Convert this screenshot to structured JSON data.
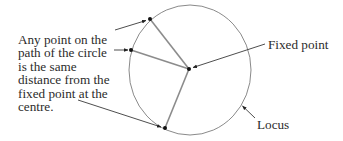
{
  "diagram": {
    "description_lines": [
      "Any point on the",
      "path of the circle",
      "is the same",
      "distance from the",
      "fixed point at the",
      "centre."
    ],
    "labels": {
      "fixed_point": "Fixed point",
      "locus": "Locus"
    },
    "circle": {
      "cx": 190,
      "cy": 70,
      "rx": 61,
      "ry": 65,
      "stroke": "#8a8a8a"
    },
    "centre_point": {
      "x": 189,
      "y": 69
    },
    "points_on_circle": [
      {
        "x": 150,
        "y": 19
      },
      {
        "x": 131,
        "y": 50
      },
      {
        "x": 165,
        "y": 128
      }
    ],
    "colors": {
      "radius_line": "#8c8c8c",
      "leader_line": "#3a3a3a",
      "point": "#111111",
      "text": "#2b2b2b"
    }
  }
}
